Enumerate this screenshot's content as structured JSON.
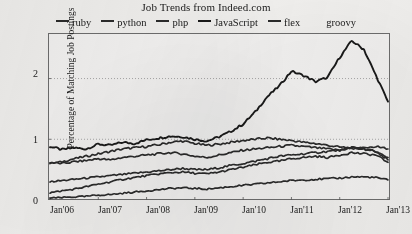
{
  "chart_data": {
    "type": "line",
    "title": "Job Trends from Indeed.com",
    "xlabel": "",
    "ylabel": "Percentage of Matching Job Postings",
    "xlim": [
      "Jan'06",
      "Jan'13"
    ],
    "ylim": [
      0,
      2.75
    ],
    "grid": true,
    "legend_position": "top",
    "y_ticks": [
      "0",
      "1",
      "2"
    ],
    "y_tick_values": [
      0,
      1,
      2
    ],
    "x_ticks": [
      "Jan'06",
      "Jan'07",
      "Jan'08",
      "Jan'09",
      "Jan'10",
      "Jan'11",
      "Jan'12",
      "Jan'13"
    ],
    "x_tick_values": [
      2006,
      2007,
      2008,
      2009,
      2010,
      2011,
      2012,
      2013
    ],
    "legend": [
      {
        "name": "ruby",
        "color": "#2b2b2b",
        "swatch": "line"
      },
      {
        "name": "python",
        "color": "#2b2b2b",
        "swatch": "line"
      },
      {
        "name": "php",
        "color": "#2b2b2b",
        "swatch": "line"
      },
      {
        "name": "JavaScript",
        "color": "#1a1a1a",
        "swatch": "line"
      },
      {
        "name": "flex",
        "color": "#2b2b2b",
        "swatch": "line"
      },
      {
        "name": "groovy",
        "color": "#2b2b2b",
        "swatch": "none"
      }
    ],
    "x": [
      2006.0,
      2006.25,
      2006.5,
      2006.75,
      2007.0,
      2007.25,
      2007.5,
      2007.75,
      2008.0,
      2008.25,
      2008.5,
      2008.75,
      2009.0,
      2009.25,
      2009.5,
      2009.75,
      2010.0,
      2010.25,
      2010.5,
      2010.75,
      2011.0,
      2011.25,
      2011.5,
      2011.75,
      2012.0,
      2012.25,
      2012.5,
      2012.75,
      2013.0
    ],
    "series": [
      {
        "name": "JavaScript",
        "color": "#1a1a1a",
        "values": [
          0.88,
          0.83,
          0.86,
          0.84,
          0.92,
          0.9,
          0.95,
          0.93,
          0.99,
          1.02,
          1.05,
          1.04,
          1.0,
          0.97,
          1.04,
          1.13,
          1.25,
          1.45,
          1.7,
          1.88,
          2.12,
          2.05,
          1.95,
          2.02,
          2.35,
          2.62,
          2.48,
          2.05,
          1.62
        ]
      },
      {
        "name": "php",
        "color": "#2b2b2b",
        "values": [
          0.6,
          0.63,
          0.68,
          0.72,
          0.76,
          0.8,
          0.84,
          0.86,
          0.88,
          0.91,
          0.95,
          0.97,
          0.93,
          0.9,
          0.92,
          0.95,
          0.98,
          1.0,
          1.02,
          1.0,
          0.98,
          0.95,
          0.93,
          0.9,
          0.87,
          0.86,
          0.84,
          0.8,
          0.7
        ]
      },
      {
        "name": "flex",
        "color": "#2b2b2b",
        "values": [
          0.62,
          0.6,
          0.63,
          0.65,
          0.68,
          0.66,
          0.7,
          0.72,
          0.74,
          0.76,
          0.78,
          0.76,
          0.72,
          0.7,
          0.74,
          0.78,
          0.82,
          0.84,
          0.86,
          0.88,
          0.9,
          0.88,
          0.86,
          0.84,
          0.82,
          0.86,
          0.84,
          0.8,
          0.66
        ]
      },
      {
        "name": "python",
        "color": "#2b2b2b",
        "values": [
          0.3,
          0.32,
          0.34,
          0.36,
          0.38,
          0.4,
          0.42,
          0.44,
          0.46,
          0.48,
          0.5,
          0.52,
          0.5,
          0.5,
          0.53,
          0.57,
          0.6,
          0.64,
          0.68,
          0.72,
          0.74,
          0.76,
          0.78,
          0.8,
          0.82,
          0.85,
          0.86,
          0.88,
          0.84
        ]
      },
      {
        "name": "ruby",
        "color": "#2b2b2b",
        "values": [
          0.12,
          0.15,
          0.18,
          0.22,
          0.26,
          0.3,
          0.34,
          0.37,
          0.4,
          0.43,
          0.45,
          0.46,
          0.44,
          0.43,
          0.46,
          0.5,
          0.54,
          0.58,
          0.62,
          0.64,
          0.68,
          0.7,
          0.72,
          0.7,
          0.74,
          0.78,
          0.76,
          0.74,
          0.62
        ]
      },
      {
        "name": "groovy",
        "color": "#2b2b2b",
        "values": [
          0.03,
          0.04,
          0.05,
          0.06,
          0.08,
          0.09,
          0.11,
          0.13,
          0.15,
          0.17,
          0.19,
          0.2,
          0.19,
          0.18,
          0.2,
          0.22,
          0.24,
          0.26,
          0.28,
          0.3,
          0.32,
          0.33,
          0.34,
          0.35,
          0.36,
          0.38,
          0.38,
          0.37,
          0.33
        ]
      }
    ]
  }
}
